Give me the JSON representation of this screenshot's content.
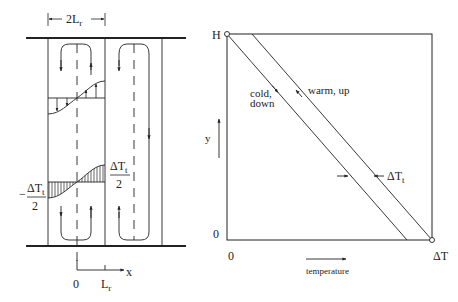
{
  "left_panel": {
    "width_label": "2L",
    "width_label_sub": "r",
    "upper_profile_label": {
      "numerator": "ΔT",
      "numerator_sub": "t",
      "denominator": "2"
    },
    "lower_profile_label": {
      "sign": "−",
      "numerator": "ΔT",
      "numerator_sub": "t",
      "denominator": "2"
    },
    "axis": {
      "x_label": "x",
      "origin_label": "0",
      "tick_label": "L",
      "tick_label_sub": "r"
    }
  },
  "right_panel": {
    "y_top_label": "H",
    "y_bottom_label": "0",
    "y_axis_label": "y",
    "x_left_label": "0",
    "x_right_label": "ΔT",
    "x_axis_label": "temperature",
    "cold_label_line1": "cold,",
    "cold_label_line2": "down",
    "warm_label": "warm, up",
    "gap_label": "ΔT",
    "gap_label_sub": "t"
  },
  "colors": {
    "line": "#222222",
    "background": "#ffffff"
  }
}
